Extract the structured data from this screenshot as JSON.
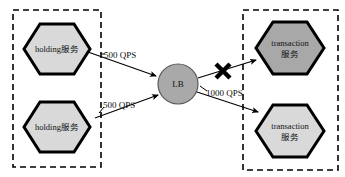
{
  "diagram": {
    "type": "architecture-flow",
    "background": "#ffffff",
    "groups": [
      {
        "id": "left-group",
        "name": "holding-service-group",
        "border_style": "dashed",
        "border_color": "#000000",
        "x": 13,
        "y": 10,
        "w": 88,
        "h": 157
      },
      {
        "id": "right-group",
        "name": "transaction-service-group",
        "border_style": "dashed",
        "border_color": "#000000",
        "x": 243,
        "y": 10,
        "w": 95,
        "h": 160
      }
    ],
    "nodes": [
      {
        "id": "holding-1",
        "shape": "hexagon",
        "label_line1": "holding服务",
        "label_line2": "",
        "fill": "#d9d9d9",
        "stroke": "#000000",
        "cx": 57,
        "cy": 49,
        "rx": 33,
        "ry": 25
      },
      {
        "id": "holding-2",
        "shape": "hexagon",
        "label_line1": "holding服务",
        "label_line2": "",
        "fill": "#d9d9d9",
        "stroke": "#000000",
        "cx": 57,
        "cy": 127,
        "rx": 33,
        "ry": 25
      },
      {
        "id": "lb",
        "shape": "circle",
        "label_line1": "LB",
        "label_line2": "",
        "fill": "#a9a9a9",
        "stroke": "#4d4d4d",
        "cx": 178,
        "cy": 84,
        "r": 20
      },
      {
        "id": "transaction-1",
        "shape": "hexagon",
        "label_line1": "transaction",
        "label_line2": "服务",
        "fill": "#a8a8a8",
        "stroke": "#000000",
        "cx": 290,
        "cy": 48,
        "rx": 34,
        "ry": 26
      },
      {
        "id": "transaction-2",
        "shape": "hexagon",
        "label_line1": "transaction",
        "label_line2": "服务",
        "fill": "#d9d9d9",
        "stroke": "#000000",
        "cx": 290,
        "cy": 131,
        "rx": 34,
        "ry": 26
      }
    ],
    "edges": [
      {
        "id": "edge-holding1-lb",
        "from": "holding-1",
        "to": "lb",
        "label": "500 QPS",
        "label_x": 104,
        "label_y": 57,
        "blocked": false
      },
      {
        "id": "edge-holding2-lb",
        "from": "holding-2",
        "to": "lb",
        "label": "500 QPS",
        "label_x": 103,
        "label_y": 105,
        "blocked": false
      },
      {
        "id": "edge-lb-transaction1",
        "from": "lb",
        "to": "transaction-1",
        "label": "",
        "blocked": true,
        "block_marker": "x-cross",
        "block_x": 223,
        "block_y": 71
      },
      {
        "id": "edge-lb-transaction2",
        "from": "lb",
        "to": "transaction-2",
        "label": "1000 QPS",
        "label_x": 206,
        "label_y": 93,
        "blocked": false
      }
    ]
  }
}
